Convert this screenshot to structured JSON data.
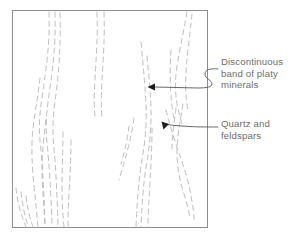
{
  "figure": {
    "title": "",
    "frame": {
      "x": 12,
      "y": 10,
      "width": 196,
      "height": 218,
      "stroke_color": "#8d8d8d",
      "fill_color": "#ffffff"
    },
    "foliation": {
      "stroke_color": "#b6b6b6",
      "dash_pattern": "5 4",
      "description": "dashed near-vertical foliation traces"
    },
    "leader_color": "#585858"
  },
  "annotations": [
    {
      "id": "discontinuous-band",
      "lines": [
        "Discontinuous",
        "band of platy",
        "minerals"
      ],
      "arrow_target": {
        "x": 148,
        "y": 87
      },
      "arrow_direction": "left"
    },
    {
      "id": "quartz-feldspars",
      "lines": [
        "Quartz and",
        "feldspars"
      ],
      "arrow_target": {
        "x": 164,
        "y": 126
      },
      "arrow_direction": "down-left"
    }
  ],
  "colors": {
    "text": "#6e6e6e",
    "frame": "#8d8d8d",
    "foliation": "#b6b6b6",
    "leader": "#585858",
    "background": "#ffffff"
  }
}
